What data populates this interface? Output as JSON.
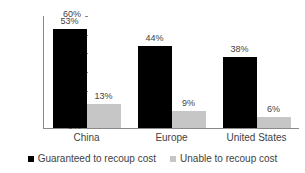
{
  "chart_data": {
    "type": "bar",
    "title": "",
    "subtitle": "",
    "xlabel": "",
    "ylabel": "",
    "categories": [
      "China",
      "Europe",
      "United States"
    ],
    "series": [
      {
        "name": "Guaranteed to recoup cost",
        "color": "#000000",
        "values": [
          53,
          44,
          38
        ],
        "labels": [
          "53%",
          "44%",
          "38%"
        ]
      },
      {
        "name": "Unable to recoup cost",
        "color": "#c6c6c6",
        "values": [
          13,
          9,
          6
        ],
        "labels": [
          "13%",
          "9%",
          "6%"
        ]
      }
    ],
    "ylim": [
      0,
      60
    ],
    "ytick_values": [
      0,
      10,
      20,
      30,
      40,
      50,
      60
    ],
    "ytick_labels": [
      "0%",
      "10%",
      "20%",
      "30%",
      "40%",
      "50%",
      "60%"
    ],
    "grid": false,
    "legend_position": "bottom",
    "value_labels_shown": true
  },
  "legend": {
    "items": [
      {
        "label": "Guaranteed to recoup cost",
        "swatch": "black-square-marker"
      },
      {
        "label": "Unable to recoup cost",
        "swatch": "gray-square-marker"
      }
    ]
  },
  "colors": {
    "series_primary": "#000000",
    "series_secondary": "#c6c6c6",
    "axis": "#8a8a8a",
    "text": "#3f3f3f",
    "background": "#ffffff"
  }
}
